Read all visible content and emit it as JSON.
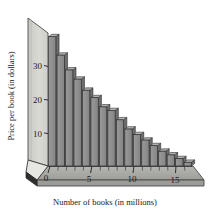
{
  "chart_data": {
    "type": "bar",
    "title": "",
    "subtitle": "",
    "xlabel": "Number of books (in millions)",
    "ylabel": "Price per book (in dollars)",
    "xlim": [
      0,
      17
    ],
    "ylim": [
      0,
      36
    ],
    "x_ticks": [
      0,
      5,
      10,
      15
    ],
    "x_tick_labels": [
      "0",
      "5",
      "10",
      "15"
    ],
    "x_minor_ticks": [
      1,
      2,
      3,
      4,
      6,
      7,
      8,
      9,
      11,
      12,
      13,
      14,
      16
    ],
    "y_ticks": [
      10,
      20,
      30
    ],
    "y_tick_labels": [
      "10",
      "20",
      "30"
    ],
    "grid": false,
    "legend": "none",
    "style": "3d-perspective-histogram",
    "bar_color": "#8c8c8c",
    "bar_edge_color": "#303030",
    "bar_side_color": "#6e6e6e",
    "wall_color": "#d2d2cd",
    "floor_color": "#a8a8a4",
    "categories": [
      "0",
      "1",
      "2",
      "3",
      "4",
      "5",
      "6",
      "7",
      "8",
      "9",
      "10",
      "11",
      "12",
      "13",
      "14",
      "15",
      "16"
    ],
    "values": [
      35,
      30,
      26,
      23.5,
      20.5,
      18.5,
      16,
      15,
      12.5,
      10,
      8.5,
      7,
      5.5,
      4,
      3,
      2,
      1
    ],
    "series": [
      {
        "name": "Price per book",
        "values": [
          35,
          30,
          26,
          23.5,
          20.5,
          18.5,
          16,
          15,
          12.5,
          10,
          8.5,
          7,
          5.5,
          4,
          3,
          2,
          1
        ]
      }
    ],
    "annotations": []
  },
  "axes": {
    "x_title": "Number of books (in millions)",
    "y_title": "Price per book (in dollars)"
  }
}
